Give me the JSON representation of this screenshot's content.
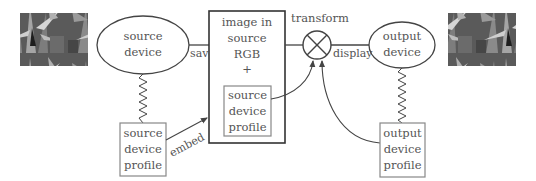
{
  "diagram": {
    "nodes": {
      "source_device": {
        "line1": "source",
        "line2": "device"
      },
      "source_profile": {
        "line1": "source",
        "line2": "device",
        "line3": "profile"
      },
      "image_box": {
        "line1": "image in",
        "line2": "source",
        "line3": "RGB",
        "line4": "+"
      },
      "embedded_profile": {
        "line1": "source",
        "line2": "device",
        "line3": "profile"
      },
      "transform": {
        "label": "transform"
      },
      "output_device": {
        "line1": "output",
        "line2": "device"
      },
      "output_profile": {
        "line1": "output",
        "line2": "device",
        "line3": "profile"
      }
    },
    "edges": {
      "save": "save",
      "display": "display",
      "embed": "embed"
    },
    "images": {
      "input_photo": "iris-photo-input",
      "output_photo": "iris-photo-output"
    },
    "colors": {
      "stroke": "#444444",
      "profile_box": "#888888",
      "text": "#555555"
    }
  }
}
